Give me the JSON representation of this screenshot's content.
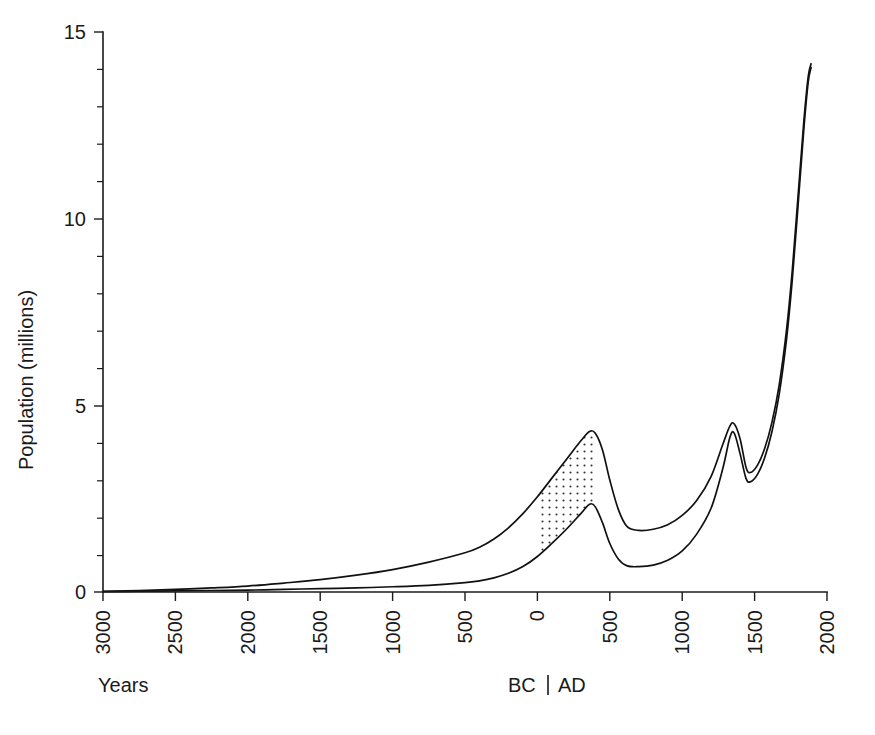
{
  "chart_data": {
    "type": "area",
    "title": "",
    "subtitle": "",
    "xlabel": "Years",
    "ylabel": "Population (millions)",
    "era_label_bc": "BC",
    "era_label_ad": "AD",
    "era_separator": "|",
    "grid": false,
    "legend": "none",
    "ylim": [
      0,
      15
    ],
    "xlim": [
      -3000,
      2000
    ],
    "y_ticks_major": [
      0,
      5,
      10,
      15
    ],
    "y_tick_labels": [
      "0",
      "5",
      "10",
      "15"
    ],
    "y_ticks_minor": [
      1,
      2,
      3,
      4,
      6,
      7,
      8,
      9,
      11,
      12,
      13,
      14
    ],
    "x_ticks": [
      -3000,
      -2500,
      -2000,
      -1500,
      -1000,
      -500,
      0,
      500,
      1000,
      1500,
      2000
    ],
    "x_tick_labels": [
      "3000",
      "2500",
      "2000",
      "1500",
      "1000",
      "500",
      "0",
      "500",
      "1000",
      "1500",
      "2000"
    ],
    "x_tick_label_rotation_deg": -90,
    "shaded_band": {
      "style": "stipple-dots",
      "start_year": 0,
      "end_year": 400,
      "description": "dotted fill between upper and lower estimate curves"
    },
    "series": [
      {
        "name": "Upper estimate",
        "points": [
          [
            -3000,
            0.02
          ],
          [
            -2750,
            0.04
          ],
          [
            -2500,
            0.07
          ],
          [
            -2250,
            0.11
          ],
          [
            -2000,
            0.16
          ],
          [
            -1750,
            0.24
          ],
          [
            -1500,
            0.33
          ],
          [
            -1250,
            0.45
          ],
          [
            -1000,
            0.6
          ],
          [
            -750,
            0.8
          ],
          [
            -500,
            1.05
          ],
          [
            -400,
            1.2
          ],
          [
            -300,
            1.42
          ],
          [
            -200,
            1.72
          ],
          [
            -100,
            2.1
          ],
          [
            0,
            2.55
          ],
          [
            100,
            3.05
          ],
          [
            200,
            3.55
          ],
          [
            300,
            4.05
          ],
          [
            360,
            4.3
          ],
          [
            400,
            4.25
          ],
          [
            450,
            3.8
          ],
          [
            500,
            3.0
          ],
          [
            560,
            2.2
          ],
          [
            620,
            1.75
          ],
          [
            700,
            1.65
          ],
          [
            800,
            1.68
          ],
          [
            900,
            1.8
          ],
          [
            1000,
            2.05
          ],
          [
            1100,
            2.45
          ],
          [
            1200,
            3.1
          ],
          [
            1280,
            3.95
          ],
          [
            1330,
            4.45
          ],
          [
            1360,
            4.5
          ],
          [
            1400,
            4.1
          ],
          [
            1440,
            3.35
          ],
          [
            1470,
            3.2
          ],
          [
            1520,
            3.4
          ],
          [
            1570,
            3.85
          ],
          [
            1620,
            4.55
          ],
          [
            1670,
            5.55
          ],
          [
            1720,
            7.0
          ],
          [
            1760,
            8.6
          ],
          [
            1800,
            10.6
          ],
          [
            1840,
            12.6
          ],
          [
            1870,
            13.8
          ],
          [
            1890,
            14.15
          ]
        ]
      },
      {
        "name": "Lower estimate",
        "points": [
          [
            -3000,
            0.01
          ],
          [
            -2750,
            0.02
          ],
          [
            -2500,
            0.03
          ],
          [
            -2250,
            0.04
          ],
          [
            -2000,
            0.05
          ],
          [
            -1750,
            0.07
          ],
          [
            -1500,
            0.09
          ],
          [
            -1250,
            0.11
          ],
          [
            -1000,
            0.14
          ],
          [
            -750,
            0.18
          ],
          [
            -500,
            0.25
          ],
          [
            -400,
            0.3
          ],
          [
            -300,
            0.38
          ],
          [
            -200,
            0.5
          ],
          [
            -100,
            0.68
          ],
          [
            0,
            0.95
          ],
          [
            100,
            1.3
          ],
          [
            200,
            1.68
          ],
          [
            300,
            2.1
          ],
          [
            360,
            2.35
          ],
          [
            400,
            2.28
          ],
          [
            450,
            1.85
          ],
          [
            500,
            1.3
          ],
          [
            560,
            0.88
          ],
          [
            620,
            0.7
          ],
          [
            700,
            0.68
          ],
          [
            800,
            0.72
          ],
          [
            900,
            0.85
          ],
          [
            1000,
            1.1
          ],
          [
            1100,
            1.55
          ],
          [
            1200,
            2.25
          ],
          [
            1280,
            3.3
          ],
          [
            1330,
            4.15
          ],
          [
            1360,
            4.25
          ],
          [
            1400,
            3.7
          ],
          [
            1440,
            3.05
          ],
          [
            1470,
            2.95
          ],
          [
            1520,
            3.15
          ],
          [
            1570,
            3.6
          ],
          [
            1620,
            4.3
          ],
          [
            1670,
            5.3
          ],
          [
            1720,
            6.75
          ],
          [
            1760,
            8.35
          ],
          [
            1800,
            10.35
          ],
          [
            1840,
            12.4
          ],
          [
            1870,
            13.65
          ],
          [
            1890,
            14.05
          ]
        ]
      }
    ],
    "colors": {
      "curve": "#111111",
      "axis": "#1a1a1a",
      "background": "#ffffff",
      "stipple": "#333333"
    }
  }
}
